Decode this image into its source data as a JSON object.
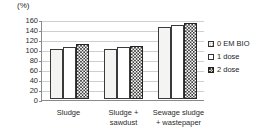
{
  "chart_data": {
    "type": "bar",
    "title": "",
    "subtitle": "",
    "unit_label": "(%)",
    "xlabel": "",
    "ylabel": "",
    "ylim": [
      0,
      160
    ],
    "ytick_step": 20,
    "yticks": [
      "160",
      "140",
      "120",
      "100",
      "80",
      "60",
      "40",
      "20",
      "0"
    ],
    "grid": true,
    "legend_position": "right",
    "categories": [
      "Sludge",
      "Sludge +\nsawdust",
      "Sewage sludge\n+ wastepaper"
    ],
    "series": [
      {
        "name": "0 EM BIO",
        "values": [
          100,
          100,
          145
        ]
      },
      {
        "name": "1 dose",
        "values": [
          105,
          104,
          149
        ]
      },
      {
        "name": "2 dose",
        "values": [
          111,
          107,
          152
        ]
      }
    ],
    "colors": {
      "axis": "#8a8a8a",
      "gridline": "#cfcfcf",
      "bar_outline": "#3a3a3a",
      "series_0_fill": "#f4f4f2",
      "series_1_fill": "#ffffff",
      "series_2_fill": "#fbfbfa",
      "text": "#2b2b2b"
    }
  },
  "legend": {
    "items": [
      {
        "label": "0 EM BIO"
      },
      {
        "label": "1 dose"
      },
      {
        "label": "2 dose"
      }
    ]
  }
}
